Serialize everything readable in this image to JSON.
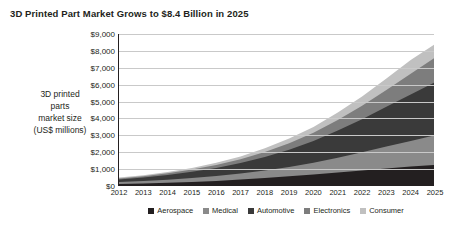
{
  "title": "3D Printed Part Market Grows to $8.4 Billion in 2025",
  "ylabel_lines": [
    "3D printed",
    "parts",
    "market size",
    "(US$ millions)"
  ],
  "chart_data": {
    "type": "area",
    "stacked": true,
    "title": "3D Printed Part Market Grows to $8.4 Billion in 2025",
    "xlabel": "",
    "ylabel": "3D printed parts market size (US$ millions)",
    "ylim": [
      0,
      9000
    ],
    "yticks": [
      0,
      1000,
      2000,
      3000,
      4000,
      5000,
      6000,
      7000,
      8000,
      9000
    ],
    "ytick_labels": [
      "$0",
      "$1,000",
      "$2,000",
      "$3,000",
      "$4,000",
      "$5,000",
      "$6,000",
      "$7,000",
      "$8,000",
      "$9,000"
    ],
    "grid": true,
    "legend_position": "bottom",
    "categories": [
      2012,
      2013,
      2014,
      2015,
      2016,
      2017,
      2018,
      2019,
      2020,
      2021,
      2022,
      2023,
      2024,
      2025
    ],
    "series": [
      {
        "name": "Aerospace",
        "color": "#231f20",
        "values": [
          120,
          150,
          190,
          240,
          300,
          380,
          470,
          570,
          680,
          800,
          920,
          1040,
          1150,
          1250
        ]
      },
      {
        "name": "Medical",
        "color": "#8a8a8a",
        "values": [
          110,
          140,
          180,
          230,
          290,
          360,
          450,
          560,
          700,
          880,
          1080,
          1300,
          1520,
          1750
        ]
      },
      {
        "name": "Automotive",
        "color": "#3a3a3a",
        "values": [
          160,
          210,
          280,
          370,
          480,
          620,
          800,
          1020,
          1280,
          1600,
          1950,
          2350,
          2750,
          3150
        ]
      },
      {
        "name": "Electronics",
        "color": "#7d7d7d",
        "values": [
          60,
          80,
          100,
          130,
          170,
          220,
          290,
          380,
          490,
          630,
          800,
          1000,
          1220,
          1450
        ]
      },
      {
        "name": "Consumer",
        "color": "#c0c0c0",
        "values": [
          50,
          60,
          80,
          100,
          130,
          170,
          220,
          280,
          350,
          440,
          550,
          680,
          820,
          800
        ]
      }
    ],
    "totals": [
      500,
      640,
      830,
      1070,
      1370,
      1750,
      2230,
      2810,
      3500,
      4350,
      5300,
      6370,
      7460,
      8400
    ]
  },
  "legend": [
    {
      "label": "Aerospace",
      "color": "#231f20"
    },
    {
      "label": "Medical",
      "color": "#8a8a8a"
    },
    {
      "label": "Automotive",
      "color": "#3a3a3a"
    },
    {
      "label": "Electronics",
      "color": "#7d7d7d"
    },
    {
      "label": "Consumer",
      "color": "#c0c0c0"
    }
  ]
}
